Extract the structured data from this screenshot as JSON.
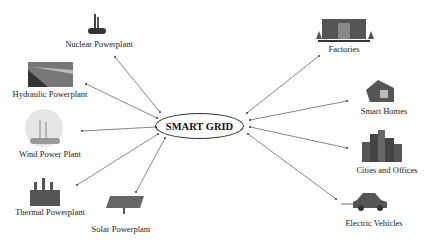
{
  "diagram": {
    "center": {
      "label": "SMART GRID"
    },
    "sources": [
      {
        "label": "Nuclear Powerplant",
        "icon": "nuclear-plant-icon"
      },
      {
        "label": "Hydraulic Powerplant",
        "icon": "hydro-dam-icon"
      },
      {
        "label": "Wind Power Plant",
        "icon": "wind-turbine-icon"
      },
      {
        "label": "Thermal Powerplant",
        "icon": "thermal-plant-icon"
      },
      {
        "label": "Solar Powerplant",
        "icon": "solar-panel-icon"
      }
    ],
    "consumers": [
      {
        "label": "Factories",
        "icon": "factory-icon"
      },
      {
        "label": "Smart Homes",
        "icon": "house-icon"
      },
      {
        "label": "Cities and Offices",
        "icon": "city-icon"
      },
      {
        "label": "Electric Vehicles",
        "icon": "electric-car-icon"
      }
    ],
    "colors": {
      "line": "#555555",
      "text": "#222222"
    }
  }
}
